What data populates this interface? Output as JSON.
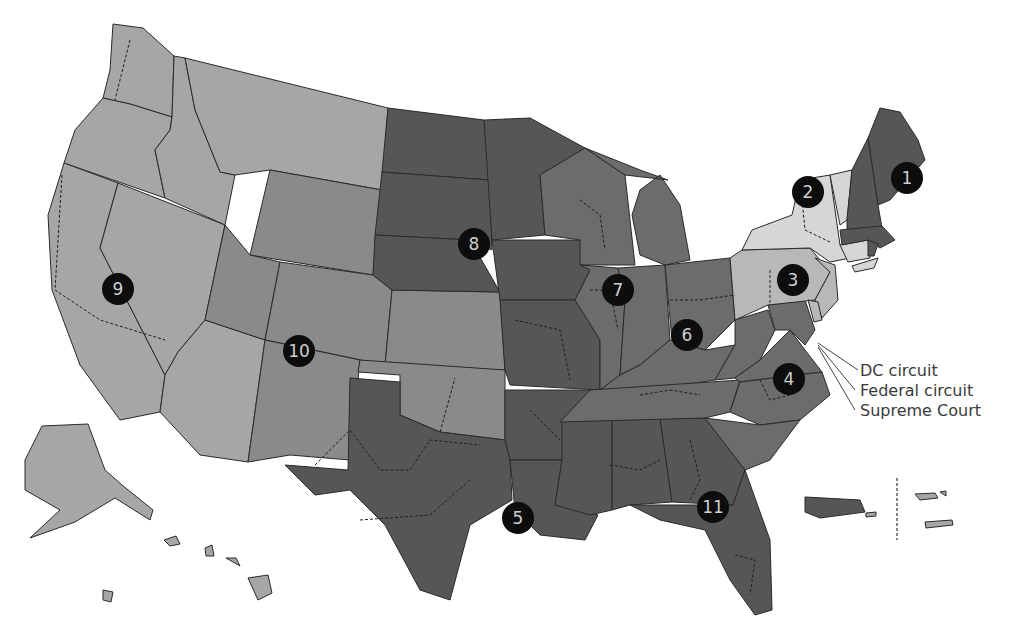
{
  "map": {
    "title": "U.S. Federal Courts of Appeals Circuits",
    "colors": {
      "light": "#a6a6a6",
      "lighter": "#d6d6d6",
      "medium": "#8a8a8a",
      "medium_dark": "#6c6c6c",
      "dark": "#565656",
      "marker": "#0d0d0d",
      "marker_text": "#cfcfcf"
    },
    "circuits": [
      {
        "number": "1",
        "tone": "dark"
      },
      {
        "number": "2",
        "tone": "lighter"
      },
      {
        "number": "3",
        "tone": "light"
      },
      {
        "number": "4",
        "tone": "medium_dark"
      },
      {
        "number": "5",
        "tone": "dark"
      },
      {
        "number": "6",
        "tone": "medium_dark"
      },
      {
        "number": "7",
        "tone": "medium_dark"
      },
      {
        "number": "8",
        "tone": "dark"
      },
      {
        "number": "9",
        "tone": "light"
      },
      {
        "number": "10",
        "tone": "medium"
      },
      {
        "number": "11",
        "tone": "dark"
      }
    ],
    "callouts": [
      {
        "label": "DC circuit"
      },
      {
        "label": "Federal circuit"
      },
      {
        "label": "Supreme Court"
      }
    ]
  }
}
